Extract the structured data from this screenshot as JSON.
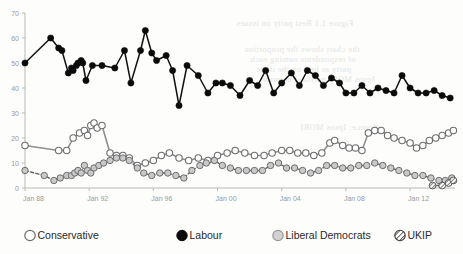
{
  "chart_data": {
    "type": "line",
    "title": "",
    "subtitle": "",
    "xlabel": "",
    "ylabel": "",
    "xlim": [
      1988.0,
      2014.8
    ],
    "ylim": [
      0,
      70
    ],
    "grid": false,
    "legend_position": "bottom",
    "x_tick_labels": [
      "Jan 88",
      "Jan 92",
      "Jan 96",
      "Jan 00",
      "Jan 04",
      "Jan 08",
      "Jan 12"
    ],
    "x_tick_values": [
      1988,
      1992,
      1996,
      2000,
      2004,
      2008,
      2012
    ],
    "y_tick_labels": [
      "0",
      "10",
      "20",
      "30",
      "40",
      "50",
      "60",
      "70"
    ],
    "y_tick_values": [
      0,
      10,
      20,
      30,
      40,
      50,
      60,
      70
    ],
    "series": [
      {
        "name": "Conservative",
        "marker": "open-circle",
        "color": "#ffffff",
        "edge_color": "#6d6d6d",
        "line_style": "solid",
        "points": [
          [
            1988.0,
            17
          ],
          [
            1990.1,
            15
          ],
          [
            1990.6,
            15
          ],
          [
            1991.0,
            20
          ],
          [
            1991.4,
            22
          ],
          [
            1991.7,
            23
          ],
          [
            1991.9,
            21
          ],
          [
            1992.1,
            25
          ],
          [
            1992.3,
            26
          ],
          [
            1992.5,
            24
          ],
          [
            1992.8,
            25
          ],
          [
            1993.3,
            14
          ],
          [
            1993.7,
            13
          ],
          [
            1994.1,
            13
          ],
          [
            1994.5,
            12
          ],
          [
            1995.0,
            9
          ],
          [
            1995.5,
            10
          ],
          [
            1996.0,
            11
          ],
          [
            1996.5,
            13
          ],
          [
            1997.0,
            14
          ],
          [
            1997.6,
            12
          ],
          [
            1998.2,
            11
          ],
          [
            1998.8,
            12
          ],
          [
            1999.4,
            11
          ],
          [
            2000.0,
            13
          ],
          [
            2000.6,
            14
          ],
          [
            2001.1,
            15
          ],
          [
            2001.7,
            14
          ],
          [
            2002.3,
            13
          ],
          [
            2002.9,
            13
          ],
          [
            2003.4,
            14
          ],
          [
            2004.0,
            15
          ],
          [
            2004.5,
            15
          ],
          [
            2005.0,
            14
          ],
          [
            2005.5,
            14
          ],
          [
            2006.0,
            13
          ],
          [
            2006.5,
            14
          ],
          [
            2007.0,
            18
          ],
          [
            2007.3,
            19
          ],
          [
            2007.8,
            17
          ],
          [
            2008.2,
            16
          ],
          [
            2008.6,
            16
          ],
          [
            2009.0,
            15
          ],
          [
            2009.4,
            22
          ],
          [
            2009.8,
            23
          ],
          [
            2010.2,
            23
          ],
          [
            2010.6,
            21
          ],
          [
            2011.0,
            20
          ],
          [
            2011.5,
            19
          ],
          [
            2012.0,
            18
          ],
          [
            2012.4,
            16
          ],
          [
            2012.8,
            17
          ],
          [
            2013.2,
            19
          ],
          [
            2013.6,
            20
          ],
          [
            2014.0,
            21
          ],
          [
            2014.4,
            22
          ],
          [
            2014.7,
            23
          ]
        ]
      },
      {
        "name": "Labour",
        "marker": "filled-circle",
        "color": "#0b0b0b",
        "edge_color": "#0b0b0b",
        "line_style": "solid",
        "points": [
          [
            1988.0,
            50
          ],
          [
            1989.6,
            60
          ],
          [
            1990.1,
            56
          ],
          [
            1990.3,
            55
          ],
          [
            1990.7,
            46
          ],
          [
            1990.9,
            48
          ],
          [
            1991.0,
            47
          ],
          [
            1991.2,
            49
          ],
          [
            1991.3,
            50
          ],
          [
            1991.5,
            51
          ],
          [
            1991.6,
            50
          ],
          [
            1991.8,
            43
          ],
          [
            1992.2,
            49
          ],
          [
            1992.8,
            49
          ],
          [
            1993.6,
            48
          ],
          [
            1994.2,
            55
          ],
          [
            1994.6,
            42
          ],
          [
            1995.2,
            55
          ],
          [
            1995.5,
            63
          ],
          [
            1995.9,
            54
          ],
          [
            1996.2,
            51
          ],
          [
            1996.8,
            53
          ],
          [
            1997.2,
            47
          ],
          [
            1997.6,
            33
          ],
          [
            1998.1,
            49
          ],
          [
            1998.8,
            45
          ],
          [
            1999.4,
            38
          ],
          [
            1999.9,
            42
          ],
          [
            2000.3,
            42
          ],
          [
            2000.8,
            41
          ],
          [
            2001.4,
            37
          ],
          [
            2002.0,
            43
          ],
          [
            2002.5,
            41
          ],
          [
            2003.0,
            47
          ],
          [
            2003.5,
            38
          ],
          [
            2004.0,
            42
          ],
          [
            2004.6,
            46
          ],
          [
            2005.1,
            41
          ],
          [
            2005.6,
            47
          ],
          [
            2006.1,
            45
          ],
          [
            2006.6,
            41
          ],
          [
            2007.1,
            44
          ],
          [
            2007.6,
            42
          ],
          [
            2008.0,
            38
          ],
          [
            2008.5,
            38
          ],
          [
            2009.0,
            41
          ],
          [
            2009.5,
            38
          ],
          [
            2010.0,
            40
          ],
          [
            2010.5,
            39
          ],
          [
            2011.0,
            38
          ],
          [
            2011.5,
            45
          ],
          [
            2012.0,
            40
          ],
          [
            2012.5,
            38
          ],
          [
            2013.0,
            38
          ],
          [
            2013.5,
            39
          ],
          [
            2014.0,
            37
          ],
          [
            2014.5,
            36
          ]
        ]
      },
      {
        "name": "Liberal Democrats",
        "marker": "grey-circle",
        "color": "#c9c9c9",
        "edge_color": "#6d6d6d",
        "line_style": "dashed",
        "points": [
          [
            1988.0,
            7
          ],
          [
            1989.2,
            5
          ],
          [
            1989.8,
            3
          ],
          [
            1990.2,
            4
          ],
          [
            1990.6,
            5
          ],
          [
            1990.9,
            5
          ],
          [
            1991.1,
            6
          ],
          [
            1991.3,
            7
          ],
          [
            1991.5,
            6
          ],
          [
            1991.7,
            9
          ],
          [
            1991.9,
            7
          ],
          [
            1992.1,
            6
          ],
          [
            1992.3,
            8
          ],
          [
            1992.6,
            9
          ],
          [
            1992.9,
            10
          ],
          [
            1993.3,
            11
          ],
          [
            1993.7,
            12
          ],
          [
            1994.1,
            12
          ],
          [
            1994.5,
            11
          ],
          [
            1995.0,
            8
          ],
          [
            1995.4,
            6
          ],
          [
            1995.9,
            5
          ],
          [
            1996.4,
            6
          ],
          [
            1996.9,
            6
          ],
          [
            1997.4,
            5
          ],
          [
            1997.9,
            4
          ],
          [
            1998.4,
            7
          ],
          [
            1998.9,
            9
          ],
          [
            1999.3,
            10
          ],
          [
            1999.8,
            11
          ],
          [
            2000.3,
            9
          ],
          [
            2000.8,
            8
          ],
          [
            2001.3,
            7
          ],
          [
            2001.8,
            7
          ],
          [
            2002.3,
            7
          ],
          [
            2002.8,
            7
          ],
          [
            2003.3,
            9
          ],
          [
            2003.8,
            10
          ],
          [
            2004.3,
            8
          ],
          [
            2004.8,
            8
          ],
          [
            2005.3,
            7
          ],
          [
            2005.8,
            6
          ],
          [
            2006.3,
            7
          ],
          [
            2006.8,
            9
          ],
          [
            2007.3,
            9
          ],
          [
            2007.8,
            8
          ],
          [
            2008.3,
            8
          ],
          [
            2008.8,
            9
          ],
          [
            2009.3,
            9
          ],
          [
            2009.8,
            10
          ],
          [
            2010.3,
            9
          ],
          [
            2010.8,
            8
          ],
          [
            2011.3,
            7
          ],
          [
            2011.8,
            6
          ],
          [
            2012.3,
            5
          ],
          [
            2012.8,
            5
          ],
          [
            2013.3,
            4
          ],
          [
            2013.8,
            3
          ],
          [
            2014.2,
            3
          ],
          [
            2014.6,
            4
          ]
        ]
      },
      {
        "name": "UKIP",
        "marker": "hatched-circle",
        "color": "#ffffff",
        "edge_color": "#5a5a5a",
        "line_style": "solid",
        "points": [
          [
            2013.4,
            1
          ],
          [
            2014.0,
            1
          ],
          [
            2014.4,
            2
          ],
          [
            2014.7,
            3
          ]
        ]
      }
    ]
  },
  "legend": {
    "items": [
      {
        "label": "Conservative",
        "marker": "open-circle"
      },
      {
        "label": "Labour",
        "marker": "filled-circle"
      },
      {
        "label": "Liberal Democrats",
        "marker": "grey-circle"
      },
      {
        "label": "UKIP",
        "marker": "hatched-circle"
      }
    ]
  },
  "background_bleed": [
    {
      "text": "Figure 1.1 Best party on issues",
      "x": 236,
      "y": 18
    },
    {
      "text": "the chart shows the proportion",
      "x": 244,
      "y": 44
    },
    {
      "text": "of respondents naming each",
      "x": 250,
      "y": 54
    },
    {
      "text": "party as best on the issue",
      "x": 256,
      "y": 64
    },
    {
      "text": "Ipsos MORI political monitor",
      "x": 262,
      "y": 74
    },
    {
      "text": "Source: Ipsos MORI",
      "x": 300,
      "y": 122
    }
  ]
}
